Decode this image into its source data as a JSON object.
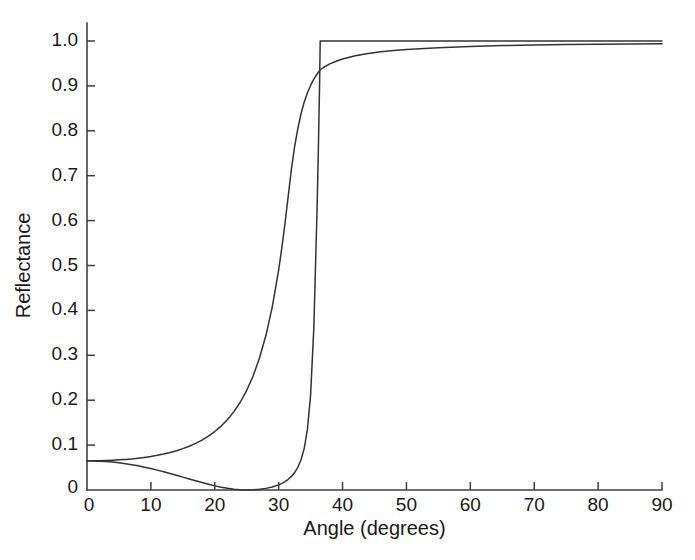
{
  "chart_data": {
    "type": "line",
    "title": "",
    "subtitle": "",
    "xlabel": "Angle (degrees)",
    "ylabel": "Reflectance",
    "xlim": [
      0,
      90
    ],
    "ylim": [
      0,
      1.0
    ],
    "xticks": [
      0,
      10,
      20,
      30,
      40,
      50,
      60,
      70,
      80,
      90
    ],
    "xtick_labels": [
      "0",
      "10",
      "20",
      "30",
      "40",
      "50",
      "60",
      "70",
      "80",
      "90"
    ],
    "yticks": [
      0,
      0.1,
      0.2,
      0.3,
      0.4,
      0.5,
      0.6,
      0.7,
      0.8,
      0.9,
      1.0
    ],
    "ytick_labels": [
      "0",
      "0.1",
      "0.2",
      "0.3",
      "0.4",
      "0.5",
      "0.6",
      "0.7",
      "0.8",
      "0.9",
      "1.0"
    ],
    "grid": false,
    "legend": false,
    "legend_position": "none",
    "annotations": [],
    "line_color": "#333333",
    "background_color": "#ffffff",
    "axis_color": "#404040",
    "critical_angle": 36.5,
    "brewster_angle": 31,
    "x": [
      0,
      1,
      2,
      3,
      4,
      5,
      6,
      7,
      8,
      9,
      10,
      11,
      12,
      13,
      14,
      15,
      16,
      17,
      18,
      19,
      20,
      21,
      22,
      23,
      24,
      25,
      26,
      27,
      28,
      29,
      30,
      30.5,
      31,
      31.5,
      32,
      32.5,
      33,
      33.5,
      34,
      34.5,
      35,
      35.5,
      36,
      36.2,
      36.4,
      36.5,
      36.5,
      37,
      38,
      39,
      40,
      42,
      44,
      46,
      48,
      50,
      55,
      60,
      65,
      70,
      75,
      80,
      85,
      90
    ],
    "series": [
      {
        "name": "p-polarization",
        "values": [
          0.065,
          0.0648,
          0.0643,
          0.0634,
          0.0622,
          0.0606,
          0.0587,
          0.0564,
          0.0538,
          0.0509,
          0.0477,
          0.0443,
          0.0406,
          0.0368,
          0.0328,
          0.0287,
          0.0246,
          0.0205,
          0.0165,
          0.0127,
          0.0092,
          0.0062,
          0.0037,
          0.0019,
          0.0007,
          0.0002,
          0.0004,
          0.0015,
          0.0036,
          0.0068,
          0.0115,
          0.0147,
          0.0187,
          0.0238,
          0.0303,
          0.0389,
          0.0506,
          0.0673,
          0.0928,
          0.135,
          0.212,
          0.36,
          0.62,
          0.75,
          0.9,
          1.0,
          1.0,
          1.0,
          1.0,
          1.0,
          1.0,
          1.0,
          1.0,
          1.0,
          1.0,
          1.0,
          1.0,
          1.0,
          1.0,
          1.0,
          1.0,
          1.0,
          1.0,
          1.0
        ]
      },
      {
        "name": "s-polarization",
        "values": [
          0.065,
          0.0651,
          0.0653,
          0.0657,
          0.0663,
          0.0671,
          0.0681,
          0.0693,
          0.0708,
          0.0726,
          0.0747,
          0.0772,
          0.0801,
          0.0835,
          0.0875,
          0.0921,
          0.0975,
          0.1038,
          0.1112,
          0.1199,
          0.1302,
          0.1424,
          0.157,
          0.1746,
          0.196,
          0.222,
          0.254,
          0.294,
          0.344,
          0.408,
          0.49,
          0.54,
          0.595,
          0.655,
          0.715,
          0.765,
          0.805,
          0.838,
          0.864,
          0.884,
          0.901,
          0.915,
          0.926,
          0.93,
          0.934,
          0.936,
          0.936,
          0.941,
          0.949,
          0.955,
          0.96,
          0.967,
          0.972,
          0.976,
          0.979,
          0.981,
          0.985,
          0.988,
          0.99,
          0.991,
          0.992,
          0.993,
          0.9935,
          0.994
        ]
      }
    ]
  },
  "figure": {
    "plot_left_px": 87,
    "plot_right_px": 662,
    "plot_top_px": 41,
    "plot_bottom_px": 490
  }
}
